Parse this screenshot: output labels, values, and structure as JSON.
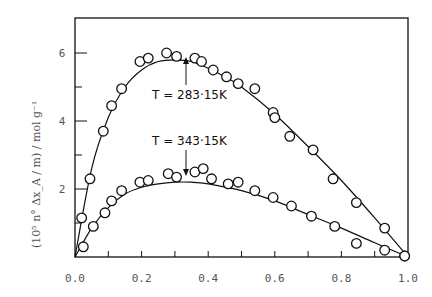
{
  "chart_data": {
    "type": "scatter",
    "title": "",
    "xlabel": "",
    "ylabel": "(10^5 n° Δx_A / m) / mol g^-1",
    "xlim": [
      0.0,
      1.0
    ],
    "ylim": [
      0,
      7
    ],
    "x_ticks": [
      "0.0",
      "0.2",
      "0.4",
      "0.6",
      "0.8",
      "1.0"
    ],
    "y_ticks": [
      "2",
      "4",
      "6"
    ],
    "grid": false,
    "legend": null,
    "annotations": [
      {
        "text": "T = 283·15K",
        "series": "T=283.15K"
      },
      {
        "text": "T = 343·15K",
        "series": "T=343.15K"
      }
    ],
    "series": [
      {
        "name": "T=283.15K",
        "points": [
          [
            0.02,
            1.15
          ],
          [
            0.045,
            2.3
          ],
          [
            0.085,
            3.7
          ],
          [
            0.11,
            4.45
          ],
          [
            0.14,
            4.95
          ],
          [
            0.195,
            5.75
          ],
          [
            0.22,
            5.85
          ],
          [
            0.275,
            6.0
          ],
          [
            0.305,
            5.9
          ],
          [
            0.36,
            5.85
          ],
          [
            0.38,
            5.75
          ],
          [
            0.415,
            5.5
          ],
          [
            0.455,
            5.3
          ],
          [
            0.49,
            5.1
          ],
          [
            0.54,
            4.95
          ],
          [
            0.595,
            4.25
          ],
          [
            0.6,
            4.1
          ],
          [
            0.645,
            3.55
          ],
          [
            0.715,
            3.15
          ],
          [
            0.775,
            2.3
          ],
          [
            0.845,
            1.6
          ],
          [
            0.93,
            0.85
          ],
          [
            0.99,
            0.03
          ]
        ],
        "fit_curve": [
          [
            0,
            0
          ],
          [
            0.05,
            2.6
          ],
          [
            0.1,
            4.1
          ],
          [
            0.15,
            5.0
          ],
          [
            0.2,
            5.5
          ],
          [
            0.25,
            5.75
          ],
          [
            0.3,
            5.8
          ],
          [
            0.35,
            5.75
          ],
          [
            0.4,
            5.55
          ],
          [
            0.45,
            5.3
          ],
          [
            0.5,
            5.0
          ],
          [
            0.6,
            4.2
          ],
          [
            0.7,
            3.25
          ],
          [
            0.8,
            2.25
          ],
          [
            0.9,
            1.15
          ],
          [
            1.0,
            0
          ]
        ]
      },
      {
        "name": "T=343.15K",
        "points": [
          [
            0.025,
            0.3
          ],
          [
            0.055,
            0.9
          ],
          [
            0.09,
            1.3
          ],
          [
            0.11,
            1.65
          ],
          [
            0.14,
            1.95
          ],
          [
            0.195,
            2.2
          ],
          [
            0.22,
            2.25
          ],
          [
            0.28,
            2.45
          ],
          [
            0.305,
            2.35
          ],
          [
            0.36,
            2.5
          ],
          [
            0.385,
            2.6
          ],
          [
            0.41,
            2.3
          ],
          [
            0.46,
            2.15
          ],
          [
            0.49,
            2.2
          ],
          [
            0.54,
            1.95
          ],
          [
            0.595,
            1.75
          ],
          [
            0.65,
            1.5
          ],
          [
            0.71,
            1.2
          ],
          [
            0.78,
            0.9
          ],
          [
            0.845,
            0.4
          ],
          [
            0.93,
            0.2
          ],
          [
            0.99,
            0.03
          ]
        ],
        "fit_curve": [
          [
            0,
            0
          ],
          [
            0.05,
            0.85
          ],
          [
            0.1,
            1.45
          ],
          [
            0.15,
            1.85
          ],
          [
            0.2,
            2.05
          ],
          [
            0.25,
            2.15
          ],
          [
            0.3,
            2.2
          ],
          [
            0.35,
            2.2
          ],
          [
            0.4,
            2.15
          ],
          [
            0.5,
            1.95
          ],
          [
            0.6,
            1.65
          ],
          [
            0.7,
            1.25
          ],
          [
            0.8,
            0.85
          ],
          [
            0.9,
            0.42
          ],
          [
            1.0,
            0
          ]
        ]
      }
    ]
  },
  "labels": {
    "y_axis": "(10⁵ n° Δx_A / m) / mol g⁻¹",
    "annot_upper": "T = 283·15K",
    "annot_lower": "T = 343·15K"
  }
}
